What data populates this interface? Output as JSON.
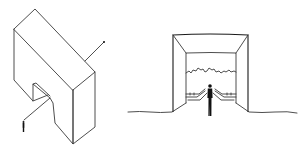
{
  "figure": {
    "panels": [
      {
        "id": "axonometric",
        "description": "Isometric sketch of a thick L/notched block with a person figure and a diagonal sight-line arrow passing through it",
        "elements": [
          "block-outline",
          "notch",
          "sight-line-arrow",
          "person-figure"
        ]
      },
      {
        "id": "perspective-view",
        "description": "One-point perspective sketch looking through a rectangular frame/tunnel toward a distant skyline, with a person standing at the entrance",
        "elements": [
          "outer-frame",
          "inner-frame",
          "skyline",
          "railings",
          "ground-line",
          "person-figure"
        ]
      }
    ],
    "colors": {
      "line": "#3a3a3a",
      "figure": "#111111",
      "background": "#ffffff"
    }
  }
}
